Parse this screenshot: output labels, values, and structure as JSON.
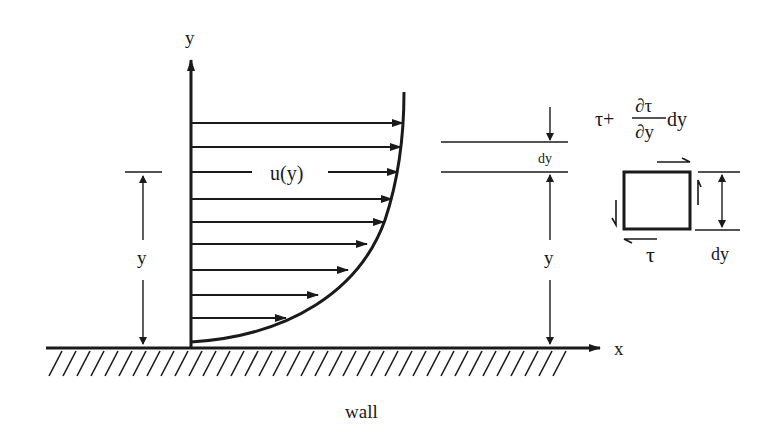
{
  "diagram": {
    "labels": {
      "y_axis": "y",
      "x_axis": "x",
      "profile": "u(y)",
      "left_height": "y",
      "right_height": "y",
      "gap": "dy",
      "element_height": "dy",
      "bottom_stress": "τ",
      "top_stress_tau": "τ+",
      "top_stress_num": "∂τ",
      "top_stress_den": "∂y",
      "top_stress_suffix": "dy",
      "wall": "wall"
    },
    "profile_arrows_y": [
      123,
      147,
      172,
      199,
      222,
      244,
      270,
      295,
      318
    ],
    "colors": {
      "ink": "#1a1a1a",
      "background": "#ffffff"
    }
  }
}
